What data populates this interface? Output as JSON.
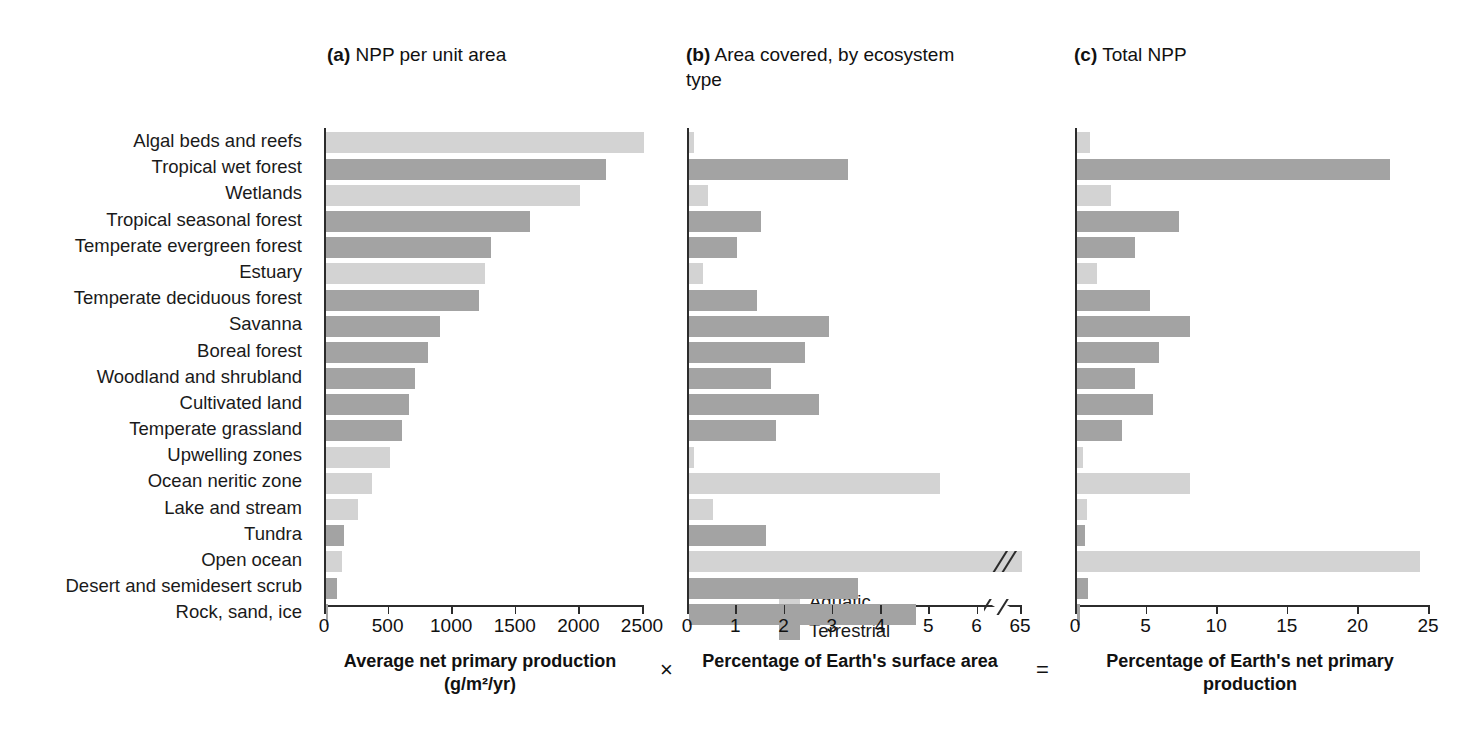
{
  "figure": {
    "panels": [
      {
        "id": "a",
        "marker": "(a)",
        "title": "NPP per unit area"
      },
      {
        "id": "b",
        "marker": "(b)",
        "title": "Area covered, by ecosystem type"
      },
      {
        "id": "c",
        "marker": "(c)",
        "title": "Total NPP"
      }
    ],
    "operators": {
      "times": "×",
      "equals": "="
    },
    "caption": ""
  },
  "legend": {
    "position": "inside-panel-a",
    "items": [
      {
        "label": "Aquatic",
        "color": "#d3d3d3"
      },
      {
        "label": "Terrestrial",
        "color": "#a3a3a3"
      }
    ]
  },
  "colors": {
    "aquatic": "#d3d3d3",
    "terrestrial": "#a3a3a3",
    "axis": "#2c2c2c",
    "text": "#1a1a1a"
  },
  "categories": [
    "Algal beds and reefs",
    "Tropical wet forest",
    "Wetlands",
    "Tropical seasonal forest",
    "Temperate evergreen forest",
    "Estuary",
    "Temperate deciduous forest",
    "Savanna",
    "Boreal forest",
    "Woodland and shrubland",
    "Cultivated land",
    "Temperate grassland",
    "Upwelling zones",
    "Ocean neritic zone",
    "Lake and stream",
    "Tundra",
    "Open ocean",
    "Desert and semidesert scrub",
    "Rock, sand, ice"
  ],
  "types": [
    "Aquatic",
    "Terrestrial",
    "Aquatic",
    "Terrestrial",
    "Terrestrial",
    "Aquatic",
    "Terrestrial",
    "Terrestrial",
    "Terrestrial",
    "Terrestrial",
    "Terrestrial",
    "Terrestrial",
    "Aquatic",
    "Aquatic",
    "Aquatic",
    "Terrestrial",
    "Aquatic",
    "Terrestrial",
    "Terrestrial"
  ],
  "chart_data": [
    {
      "type": "bar",
      "orientation": "horizontal",
      "panel": "a",
      "title": "(a) NPP per unit area",
      "xlabel": "Average net primary production (g/m²/yr)",
      "ylabel": "",
      "xlim": [
        0,
        2500
      ],
      "xticks": [
        0,
        500,
        1000,
        1500,
        2000,
        2500
      ],
      "xticklabels": [
        "0",
        "500",
        "1000",
        "1500",
        "2000",
        "2500"
      ],
      "grid": false,
      "categories": [
        "Algal beds and reefs",
        "Tropical wet forest",
        "Wetlands",
        "Tropical seasonal forest",
        "Temperate evergreen forest",
        "Estuary",
        "Temperate deciduous forest",
        "Savanna",
        "Boreal forest",
        "Woodland and shrubland",
        "Cultivated land",
        "Temperate grassland",
        "Upwelling zones",
        "Ocean neritic zone",
        "Lake and stream",
        "Tundra",
        "Open ocean",
        "Desert and semidesert scrub",
        "Rock, sand, ice"
      ],
      "values": [
        2500,
        2200,
        2000,
        1600,
        1300,
        1250,
        1200,
        900,
        800,
        700,
        650,
        600,
        500,
        360,
        250,
        140,
        125,
        90,
        3
      ]
    },
    {
      "type": "bar",
      "orientation": "horizontal",
      "panel": "b",
      "title": "(b) Area covered, by ecosystem type",
      "xlabel": "Percentage of Earth's surface area",
      "ylabel": "",
      "xlim": [
        0,
        6.9
      ],
      "xticks": [
        0,
        1,
        2,
        3,
        4,
        5,
        6,
        6.9
      ],
      "xticklabels": [
        "0",
        "1",
        "2",
        "3",
        "4",
        "5",
        "6",
        "65"
      ],
      "axis_break": {
        "after_tick": 6,
        "note": "axis broken between 6 and 65"
      },
      "grid": false,
      "categories": [
        "Algal beds and reefs",
        "Tropical wet forest",
        "Wetlands",
        "Tropical seasonal forest",
        "Temperate evergreen forest",
        "Estuary",
        "Temperate deciduous forest",
        "Savanna",
        "Boreal forest",
        "Woodland and shrubland",
        "Cultivated land",
        "Temperate grassland",
        "Upwelling zones",
        "Ocean neritic zone",
        "Lake and stream",
        "Tundra",
        "Open ocean",
        "Desert and semidesert scrub",
        "Rock, sand, ice"
      ],
      "values": [
        0.1,
        3.3,
        0.4,
        1.5,
        1.0,
        0.3,
        1.4,
        2.9,
        2.4,
        1.7,
        2.7,
        1.8,
        0.1,
        5.2,
        0.5,
        1.6,
        65.1,
        3.5,
        4.7
      ],
      "values_broken_display": [
        0.1,
        3.3,
        0.4,
        1.5,
        1.0,
        0.3,
        1.4,
        2.9,
        2.4,
        1.7,
        2.7,
        1.8,
        0.1,
        5.2,
        0.5,
        1.6,
        6.9,
        3.5,
        4.7
      ]
    },
    {
      "type": "bar",
      "orientation": "horizontal",
      "panel": "c",
      "title": "(c) Total NPP",
      "xlabel": "Percentage of Earth's net primary production",
      "ylabel": "",
      "xlim": [
        0,
        25
      ],
      "xticks": [
        0,
        5,
        10,
        15,
        20,
        25
      ],
      "xticklabels": [
        "0",
        "5",
        "10",
        "15",
        "20",
        "25"
      ],
      "grid": false,
      "categories": [
        "Algal beds and reefs",
        "Tropical wet forest",
        "Wetlands",
        "Tropical seasonal forest",
        "Temperate evergreen forest",
        "Estuary",
        "Temperate deciduous forest",
        "Savanna",
        "Boreal forest",
        "Woodland and shrubland",
        "Cultivated land",
        "Temperate grassland",
        "Upwelling zones",
        "Ocean neritic zone",
        "Lake and stream",
        "Tundra",
        "Open ocean",
        "Desert and semidesert scrub",
        "Rock, sand, ice"
      ],
      "values": [
        0.9,
        22.2,
        2.4,
        7.2,
        4.1,
        1.4,
        5.2,
        8.0,
        5.8,
        4.1,
        5.4,
        3.2,
        0.4,
        8.0,
        0.7,
        0.6,
        24.3,
        0.8,
        0.2
      ]
    }
  ]
}
